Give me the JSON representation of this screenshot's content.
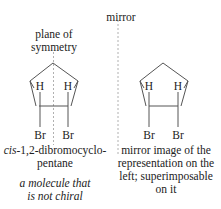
{
  "mirror_label": "mirror",
  "left": {
    "plane_label_line1": "plane of",
    "plane_label_line2": "symmetry",
    "atoms": {
      "h1": "H",
      "h2": "H",
      "br1": "Br",
      "br2": "Br"
    },
    "caption_prefix": "cis",
    "caption_rest": "-1,2-dibromocyclo-",
    "caption_line2": "pentane",
    "note_line1": "a molecule that",
    "note_line2": "is not chiral"
  },
  "right": {
    "atoms": {
      "h1": "H",
      "h2": "H",
      "br1": "Br",
      "br2": "Br"
    },
    "caption_line1": "mirror image of the",
    "caption_line2": "representation on the",
    "caption_line3": "left; superimposable",
    "caption_line4": "on it"
  },
  "colors": {
    "line": "#555555",
    "dashed": "#aaaaaa",
    "text": "#222222"
  }
}
